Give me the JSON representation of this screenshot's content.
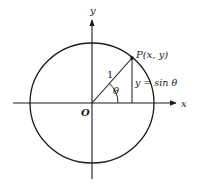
{
  "figure": {
    "type": "unit-circle-sine",
    "labels": {
      "x_axis": "x",
      "y_axis": "y",
      "origin": "O",
      "point": "P(x, y)",
      "radius": "1",
      "angle": "θ",
      "vertical_segment": "y = sin θ"
    },
    "colors": {
      "stroke": "#1a1a1a",
      "background": "#ffffff"
    }
  }
}
